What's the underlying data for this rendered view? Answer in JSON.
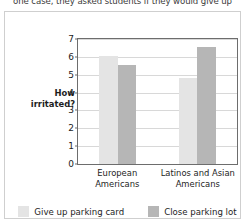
{
  "page": {
    "body_text_line": "one case, they asked students if they would give up"
  },
  "chart_data": {
    "type": "bar",
    "title": "",
    "xlabel": "",
    "ylabel": "How irritated?",
    "ylabel_lines": [
      "How",
      "irritated?"
    ],
    "ylim": [
      0,
      7
    ],
    "yticks": [
      0,
      1,
      2,
      3,
      4,
      5,
      6,
      7
    ],
    "grid": true,
    "legend_position": "bottom",
    "categories": [
      "European Americans",
      "Latinos and Asian Americans"
    ],
    "category_lines": [
      [
        "European",
        "Americans"
      ],
      [
        "Latinos and Asian",
        "Americans"
      ]
    ],
    "series": [
      {
        "name": "Give up parking card",
        "color": "#e4e4e4",
        "values": [
          6.05,
          4.8
        ]
      },
      {
        "name": "Close parking lot",
        "color": "#b6b6b6",
        "values": [
          5.55,
          6.55
        ]
      }
    ]
  }
}
